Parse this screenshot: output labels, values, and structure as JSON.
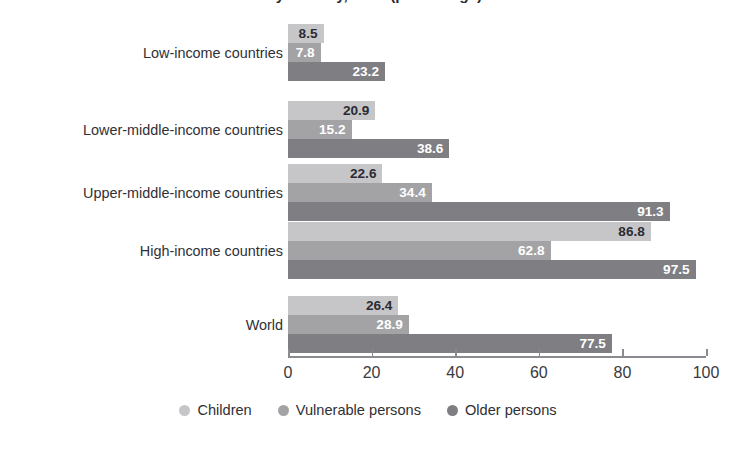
{
  "chart_data": {
    "type": "bar",
    "orientation": "horizontal",
    "title": "...by country, 2020 (percentage)",
    "title_visible_note": "title is cropped off the top edge of the screenshot",
    "xlabel": "",
    "ylabel": "",
    "xlim": [
      0,
      100
    ],
    "xticks": [
      0,
      20,
      40,
      60,
      80,
      100
    ],
    "xtick_labels": [
      "0",
      "20",
      "40",
      "60",
      "80",
      "100"
    ],
    "grid": false,
    "legend_position": "bottom-center",
    "categories": [
      "Low-income countries",
      "Lower-middle-income countries",
      "Upper-middle-income countries",
      "High-income countries",
      "World"
    ],
    "series": [
      {
        "name": "Children",
        "color": "#c6c6c8",
        "label_color": "#2b2b33",
        "values": [
          8.5,
          20.9,
          22.6,
          86.8,
          26.4
        ],
        "value_labels": [
          "8.5",
          "20.9",
          "22.6",
          "86.8",
          "26.4"
        ]
      },
      {
        "name": "Vulnerable persons",
        "color": "#a3a3a6",
        "label_color": "#ffffff",
        "values": [
          7.8,
          15.2,
          34.4,
          62.8,
          28.9
        ],
        "value_labels": [
          "7.8",
          "15.2",
          "34.4",
          "62.8",
          "28.9"
        ]
      },
      {
        "name": "Older persons",
        "color": "#7e7e83",
        "label_color": "#ffffff",
        "values": [
          23.2,
          38.6,
          91.3,
          97.5,
          77.5
        ],
        "value_labels": [
          "23.2",
          "38.6",
          "91.3",
          "97.5",
          "77.5"
        ]
      }
    ]
  },
  "legend": {
    "items": [
      {
        "label": "Children",
        "color": "#c6c6c8"
      },
      {
        "label": "Vulnerable persons",
        "color": "#a3a3a6"
      },
      {
        "label": "Older persons",
        "color": "#7e7e83"
      }
    ]
  },
  "axis": {
    "tick_labels": [
      "0",
      "20",
      "40",
      "60",
      "80",
      "100"
    ]
  }
}
